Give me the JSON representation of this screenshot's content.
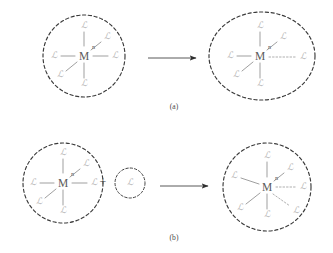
{
  "figure": {
    "background_color": "#ffffff",
    "sphere_stroke_color": "#3a3a3a",
    "bond_color": "#8e8e8e",
    "ligand_color": "#b4b4b4",
    "metal_color": "#5b5b5b",
    "arrow_color": "#2e2e2e"
  },
  "symbols": {
    "metal": "M",
    "ligand": "ℒ",
    "coordination_subscript": "n",
    "plus": "+",
    "arrow": "→"
  },
  "panels": [
    {
      "id": "a",
      "caption": "(a)",
      "reactant": {
        "name": "octahedral-complex",
        "boundary_shape": "circle",
        "metal": "M",
        "subscript": "n",
        "ligand_count": 6,
        "ligands": [
          {
            "position": "top",
            "label": "ℒ",
            "bond": "solid"
          },
          {
            "position": "upper-right",
            "label": "ℒ",
            "bond": "solid"
          },
          {
            "position": "right",
            "label": "ℒ",
            "bond": "solid"
          },
          {
            "position": "bottom",
            "label": "ℒ",
            "bond": "solid"
          },
          {
            "position": "lower-left",
            "label": "ℒ",
            "bond": "solid"
          },
          {
            "position": "left",
            "label": "ℒ",
            "bond": "solid"
          }
        ]
      },
      "product": {
        "name": "elongated-complex",
        "boundary_shape": "ellipse",
        "metal": "M",
        "subscript": "n",
        "ligand_count": 6,
        "ligands": [
          {
            "position": "top",
            "label": "ℒ",
            "bond": "solid"
          },
          {
            "position": "upper-right",
            "label": "ℒ",
            "bond": "solid"
          },
          {
            "position": "right-elongated",
            "label": "ℒ",
            "bond": "dotted"
          },
          {
            "position": "bottom",
            "label": "ℒ",
            "bond": "solid"
          },
          {
            "position": "lower-left",
            "label": "ℒ",
            "bond": "solid"
          },
          {
            "position": "left",
            "label": "ℒ",
            "bond": "solid"
          }
        ]
      }
    },
    {
      "id": "b",
      "caption": "(b)",
      "reactant": {
        "name": "octahedral-complex",
        "boundary_shape": "circle",
        "metal": "M",
        "subscript": "n",
        "ligand_count": 6,
        "ligands": [
          {
            "position": "top",
            "label": "ℒ",
            "bond": "solid"
          },
          {
            "position": "upper-right",
            "label": "ℒ",
            "bond": "solid"
          },
          {
            "position": "right",
            "label": "ℒ",
            "bond": "solid"
          },
          {
            "position": "bottom",
            "label": "ℒ",
            "bond": "solid"
          },
          {
            "position": "lower-left",
            "label": "ℒ",
            "bond": "solid"
          },
          {
            "position": "left",
            "label": "ℒ",
            "bond": "solid"
          }
        ]
      },
      "added_ligand": {
        "name": "free-ligand",
        "boundary_shape": "circle",
        "label": "ℒ",
        "ligand_count": 1
      },
      "product": {
        "name": "seven-coordinate-complex",
        "boundary_shape": "circle",
        "metal": "M",
        "subscript": "n",
        "ligand_count": 7,
        "ligands": [
          {
            "position": "top",
            "label": "ℒ",
            "bond": "solid"
          },
          {
            "position": "upper-right",
            "label": "ℒ",
            "bond": "solid"
          },
          {
            "position": "right",
            "label": "ℒ",
            "bond": "dotted"
          },
          {
            "position": "lower-right",
            "label": "ℒ",
            "bond": "dotted"
          },
          {
            "position": "bottom",
            "label": "ℒ",
            "bond": "solid"
          },
          {
            "position": "lower-left",
            "label": "ℒ",
            "bond": "solid"
          },
          {
            "position": "left",
            "label": "ℒ",
            "bond": "solid"
          }
        ]
      }
    }
  ]
}
